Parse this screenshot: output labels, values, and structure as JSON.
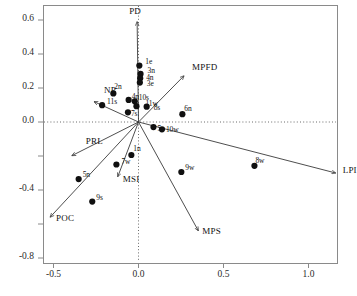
{
  "chart_data": {
    "type": "scatter",
    "title": "",
    "xlabel": "",
    "ylabel": "",
    "xlim": [
      -0.66,
      1.18
    ],
    "ylim": [
      -0.86,
      0.68
    ],
    "grid": false,
    "reference_lines": {
      "x": 0.0,
      "y": 0.0,
      "style": "dotted"
    },
    "xticks": [
      "-0.5",
      "0.0",
      "0.5",
      "1.0"
    ],
    "xtick_values": [
      -0.5,
      0.0,
      0.5,
      1.0
    ],
    "yticks": [
      "0.6",
      "0.4",
      "0.2",
      "0.0",
      "",
      "-0.4",
      "",
      "-0.8"
    ],
    "ytick_values": [
      0.6,
      0.4,
      0.2,
      0.0,
      -0.2,
      -0.4,
      -0.6,
      -0.8
    ],
    "ytick_labeled": [
      true,
      true,
      true,
      true,
      false,
      true,
      false,
      true
    ],
    "points": [
      {
        "label": "1e",
        "x": 0.005,
        "y": 0.332,
        "lx": 6,
        "ly": -9
      },
      {
        "label": "3n",
        "x": 0.012,
        "y": 0.283,
        "lx": 7,
        "ly": -8
      },
      {
        "label": "4n",
        "x": 0.01,
        "y": 0.258,
        "lx": 6,
        "ly": -5
      },
      {
        "label": "3e",
        "x": 0.008,
        "y": 0.232,
        "lx": 7,
        "ly": -4
      },
      {
        "label": "2n",
        "x": -0.148,
        "y": 0.168,
        "lx": 1,
        "ly": -11
      },
      {
        "label": "11s",
        "x": -0.214,
        "y": 0.099,
        "lx": 5,
        "ly": -8
      },
      {
        "label": "4n",
        "x": -0.058,
        "y": 0.13,
        "lx": 3,
        "ly": -8
      },
      {
        "label": "10s",
        "x": -0.022,
        "y": 0.122,
        "lx": 4,
        "ly": -8
      },
      {
        "label": "11w",
        "x": -0.012,
        "y": 0.093,
        "lx": 9,
        "ly": -7
      },
      {
        "label": "8s",
        "x": 0.048,
        "y": 0.09,
        "lx": 7,
        "ly": -4
      },
      {
        "label": "7s",
        "x": -0.062,
        "y": 0.057,
        "lx": 3,
        "ly": -3
      },
      {
        "label": "6n",
        "x": 0.258,
        "y": 0.046,
        "lx": 2,
        "ly": -10
      },
      {
        "label": "5e",
        "x": 0.088,
        "y": -0.03,
        "lx": 4,
        "ly": -3
      },
      {
        "label": "10w",
        "x": 0.138,
        "y": -0.043,
        "lx": 4,
        "ly": -4
      },
      {
        "label": "1n",
        "x": -0.042,
        "y": -0.194,
        "lx": 2,
        "ly": -11
      },
      {
        "label": "7w",
        "x": -0.13,
        "y": -0.25,
        "lx": 5,
        "ly": -8
      },
      {
        "label": "5n",
        "x": -0.352,
        "y": -0.336,
        "lx": 4,
        "ly": -9
      },
      {
        "label": "9w",
        "x": 0.252,
        "y": -0.294,
        "lx": 4,
        "ly": -9
      },
      {
        "label": "8w",
        "x": 0.682,
        "y": -0.258,
        "lx": 1,
        "ly": -10
      },
      {
        "label": "9s",
        "x": -0.272,
        "y": -0.468,
        "lx": 4,
        "ly": -9
      }
    ],
    "vectors": [
      {
        "label": "PD",
        "x": -0.008,
        "y": 0.59,
        "lx": -8,
        "ly": -16
      },
      {
        "label": "MPFD",
        "x": 0.268,
        "y": 0.272,
        "lx": 8,
        "ly": -14
      },
      {
        "label": "LPI",
        "x": 1.16,
        "y": -0.3,
        "lx": 7,
        "ly": -8
      },
      {
        "label": "MPS",
        "x": 0.352,
        "y": -0.64,
        "lx": 4,
        "ly": -5
      },
      {
        "label": "POC",
        "x": -0.52,
        "y": -0.56,
        "lx": 6,
        "ly": -4
      },
      {
        "label": "MSI",
        "x": -0.122,
        "y": -0.322,
        "lx": 5,
        "ly": -3
      },
      {
        "label": "PRL",
        "x": -0.392,
        "y": -0.198,
        "lx": 14,
        "ly": -20
      },
      {
        "label": "NP",
        "x": -0.262,
        "y": 0.12,
        "lx": 10,
        "ly": -17
      }
    ],
    "point_color": "#101010",
    "vector_color": "#3a3a3a",
    "frame_color": "#8a8a8a",
    "ref_line_color": "#6a6a6a"
  }
}
